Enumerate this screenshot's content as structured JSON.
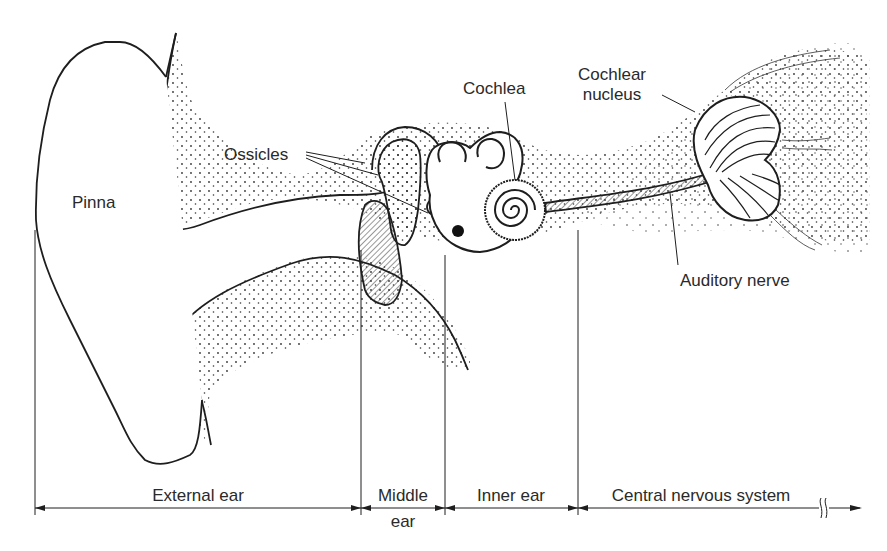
{
  "diagram": {
    "type": "anatomical-illustration",
    "structure_labels": {
      "pinna": "Pinna",
      "ossicles": "Ossicles",
      "cochlea": "Cochlea",
      "cochlear_nucleus_line1": "Cochlear",
      "cochlear_nucleus_line2": "nucleus",
      "auditory_nerve": "Auditory nerve"
    },
    "regions": [
      {
        "id": "external",
        "label": "External ear",
        "x_start": 35,
        "x_end": 361
      },
      {
        "id": "middle",
        "label_line1": "Middle",
        "label_line2": "ear",
        "x_start": 361,
        "x_end": 445
      },
      {
        "id": "inner",
        "label": "Inner ear",
        "x_start": 445,
        "x_end": 578
      },
      {
        "id": "cns",
        "label": "Central nervous system",
        "x_start": 578,
        "x_end": 860,
        "continues": true
      }
    ],
    "colors": {
      "line": "#1e1e1e",
      "text": "#2a2a2a",
      "stipple": "#333333",
      "background": "#ffffff"
    }
  }
}
